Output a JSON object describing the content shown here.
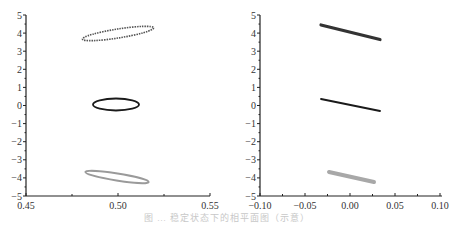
{
  "chart_data": [
    {
      "type": "scatter",
      "panel": "left",
      "title": "",
      "xlabel": "",
      "ylabel": "",
      "xlim": [
        0.45,
        0.55
      ],
      "ylim": [
        -5,
        5
      ],
      "x_ticks": [
        "0.45",
        "0.50",
        "0.55"
      ],
      "y_ticks": [
        "5",
        "4",
        "3",
        "2",
        "1",
        "0",
        "−1",
        "−2",
        "−3",
        "−4",
        "−5"
      ],
      "grid": false,
      "series": [
        {
          "name": "top-ellipse",
          "shape": "ellipse",
          "color": "#555555",
          "style": "dotted",
          "cx": 0.5,
          "cy": 4.05,
          "x_range": [
            0.481,
            0.519
          ],
          "y_range": [
            3.65,
            4.45
          ],
          "tilt": "up-right"
        },
        {
          "name": "middle-ellipse",
          "shape": "ellipse",
          "color": "#1a1a1a",
          "style": "solid",
          "cx": 0.5,
          "cy": 0.0,
          "x_range": [
            0.487,
            0.513
          ],
          "y_range": [
            -0.35,
            0.35
          ],
          "tilt": "none"
        },
        {
          "name": "bottom-ellipse",
          "shape": "ellipse",
          "color": "#9a9a9a",
          "style": "solid",
          "cx": 0.5,
          "cy": -4.0,
          "x_range": [
            0.484,
            0.516
          ],
          "y_range": [
            -4.25,
            -3.75
          ],
          "tilt": "down-right"
        }
      ]
    },
    {
      "type": "scatter",
      "panel": "right",
      "title": "",
      "xlabel": "",
      "ylabel": "",
      "xlim": [
        -0.1,
        0.1
      ],
      "ylim": [
        -5,
        5
      ],
      "x_ticks": [
        "−0.10",
        "−0.05",
        "0.00",
        "0.05",
        "0.10"
      ],
      "y_ticks": [
        "5",
        "4",
        "3",
        "2",
        "1",
        "0",
        "−1",
        "−2",
        "−3",
        "−4",
        "−5"
      ],
      "grid": false,
      "series": [
        {
          "name": "top-line",
          "shape": "thin-ellipse",
          "color": "#333333",
          "x_range": [
            -0.033,
            0.032
          ],
          "y_start": 4.45,
          "y_end": 3.65
        },
        {
          "name": "middle-line",
          "shape": "line",
          "color": "#1a1a1a",
          "x_range": [
            -0.033,
            0.032
          ],
          "y_start": 0.35,
          "y_end": -0.35
        },
        {
          "name": "bottom-line",
          "shape": "thin-ellipse",
          "color": "#a0a0a0",
          "x_range": [
            -0.025,
            0.025
          ],
          "y_start": -3.75,
          "y_end": -4.3
        }
      ]
    }
  ],
  "caption": "图 … 稳定状态下的相平面图（示意）"
}
